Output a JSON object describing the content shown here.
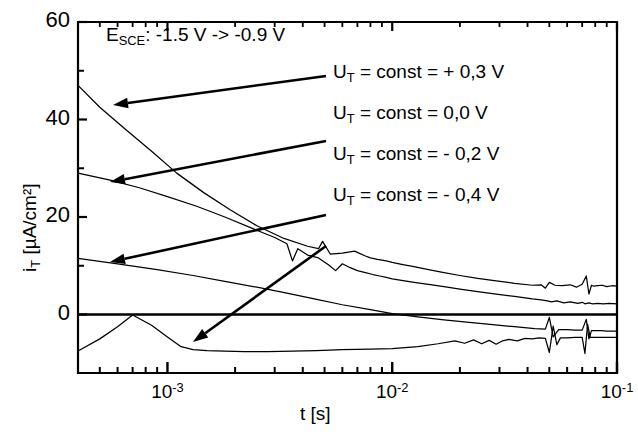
{
  "figure": {
    "background": "#ffffff",
    "line_color": "#000000",
    "axis_color": "#000000"
  },
  "annotation": {
    "head_note_prefix": "E",
    "head_note_sub": "SCE",
    "head_note_rest": ": -1.5 V -> -0.9 V"
  },
  "axes": {
    "y_label_prefix": "i",
    "y_label_sub": "T",
    "y_label_rest": " [µA/cm²]",
    "x_label": "t [s]",
    "y_ticks": [
      "60",
      "40",
      "20",
      "0"
    ],
    "y_tick_values": [
      60,
      40,
      20,
      0
    ],
    "y_minor_values": [
      50,
      30,
      10
    ],
    "x_ticks": [
      {
        "mantissa": "10",
        "exponent": "-3"
      },
      {
        "mantissa": "10",
        "exponent": "-2"
      },
      {
        "mantissa": "10",
        "exponent": "-1"
      }
    ]
  },
  "legend": [
    {
      "prefix": "U",
      "sub": "T",
      "rest": " = const = + 0,3 V",
      "value": 0.3
    },
    {
      "prefix": "U",
      "sub": "T",
      "rest": " = const =   0,0  V",
      "value": 0.0
    },
    {
      "prefix": "U",
      "sub": "T",
      "rest": " = const = - 0,2 V",
      "value": -0.2
    },
    {
      "prefix": "U",
      "sub": "T",
      "rest": " = const = - 0,4  V",
      "value": -0.4
    }
  ],
  "chart_data": {
    "type": "line",
    "title": "",
    "subtitle": "",
    "xlabel": "t [s]",
    "ylabel": "i_T [µA/cm²]",
    "xscale": "log",
    "yscale": "linear",
    "xlim": [
      0.0004,
      0.1
    ],
    "ylim": [
      -12,
      60
    ],
    "grid": false,
    "legend_position": "inside-right",
    "annotations": [
      {
        "text": "E_SCE : -1.5 V -> -0.9 V",
        "x": 0.0009,
        "y": 55
      }
    ],
    "zero_line": 0,
    "series": [
      {
        "name": "U_T = const = + 0,3 V",
        "x": [
          0.0004,
          0.0005,
          0.00065,
          0.00085,
          0.0011,
          0.00145,
          0.0019,
          0.0025,
          0.0033,
          0.0042,
          0.0047,
          0.0049,
          0.0053,
          0.006,
          0.0068,
          0.0076,
          0.008,
          0.0086,
          0.0094,
          0.01,
          0.011,
          0.0125,
          0.0145,
          0.017,
          0.02,
          0.024,
          0.029,
          0.035,
          0.042,
          0.046,
          0.048,
          0.05,
          0.053,
          0.057,
          0.062,
          0.066,
          0.07,
          0.073,
          0.075,
          0.077,
          0.079,
          0.082,
          0.086,
          0.09,
          0.095,
          0.1
        ],
        "y": [
          47.0,
          42.5,
          38.0,
          33.5,
          29.0,
          25.0,
          21.5,
          18.2,
          15.6,
          14.0,
          13.5,
          15.0,
          12.4,
          12.6,
          13.0,
          12.0,
          11.6,
          11.3,
          11.0,
          10.7,
          10.3,
          9.8,
          9.2,
          8.6,
          8.0,
          7.4,
          6.9,
          6.4,
          6.0,
          6.1,
          5.4,
          6.6,
          6.0,
          5.9,
          6.1,
          5.6,
          6.2,
          7.9,
          4.2,
          6.0,
          5.8,
          5.9,
          6.0,
          5.7,
          5.9,
          5.8
        ]
      },
      {
        "name": "U_T = const =   0,0  V",
        "x": [
          0.0004,
          0.00055,
          0.00075,
          0.001,
          0.00135,
          0.0018,
          0.0024,
          0.003,
          0.0034,
          0.0036,
          0.0038,
          0.0042,
          0.0047,
          0.0052,
          0.0056,
          0.006,
          0.0065,
          0.007,
          0.0076,
          0.0082,
          0.0088,
          0.0094,
          0.01,
          0.011,
          0.0125,
          0.0145,
          0.017,
          0.02,
          0.024,
          0.029,
          0.035,
          0.042,
          0.046,
          0.049,
          0.051,
          0.054,
          0.058,
          0.062,
          0.067,
          0.07,
          0.072,
          0.075,
          0.078,
          0.082,
          0.087,
          0.092,
          0.1
        ],
        "y": [
          29.0,
          27.6,
          26.0,
          24.2,
          22.2,
          20.0,
          17.6,
          15.8,
          14.5,
          11.0,
          13.5,
          12.2,
          11.6,
          10.2,
          9.0,
          10.4,
          9.6,
          9.0,
          8.6,
          8.2,
          7.9,
          7.6,
          7.3,
          7.0,
          6.6,
          6.2,
          5.7,
          5.2,
          4.7,
          4.2,
          3.7,
          3.2,
          3.0,
          2.8,
          2.6,
          2.8,
          2.4,
          2.6,
          2.3,
          2.5,
          2.2,
          2.4,
          2.2,
          2.3,
          2.2,
          2.3,
          2.2
        ]
      },
      {
        "name": "U_T = const = - 0,2 V",
        "x": [
          0.0004,
          0.0006,
          0.0009,
          0.0013,
          0.0018,
          0.0025,
          0.0034,
          0.0045,
          0.006,
          0.008,
          0.01,
          0.013,
          0.017,
          0.022,
          0.028,
          0.035,
          0.043,
          0.048,
          0.05,
          0.052,
          0.055,
          0.06,
          0.065,
          0.07,
          0.073,
          0.075,
          0.077,
          0.08,
          0.085,
          0.09,
          0.095,
          0.1
        ],
        "y": [
          11.5,
          10.4,
          9.2,
          8.0,
          6.8,
          5.6,
          4.4,
          3.2,
          2.0,
          1.0,
          0.2,
          -0.5,
          -1.1,
          -1.6,
          -2.1,
          -2.5,
          -2.9,
          -3.0,
          -0.6,
          -4.6,
          -3.1,
          -3.1,
          -3.2,
          -3.2,
          -1.0,
          -5.0,
          -3.3,
          -3.3,
          -3.3,
          -3.4,
          -3.4,
          -3.4
        ]
      },
      {
        "name": "U_T = const = - 0,4  V",
        "x": [
          0.0004,
          0.0005,
          0.0006,
          0.0007,
          0.00085,
          0.001,
          0.00115,
          0.0013,
          0.0015,
          0.0018,
          0.0022,
          0.0028,
          0.0036,
          0.0046,
          0.006,
          0.008,
          0.01,
          0.013,
          0.016,
          0.019,
          0.021,
          0.023,
          0.025,
          0.027,
          0.029,
          0.031,
          0.033,
          0.036,
          0.039,
          0.042,
          0.045,
          0.048,
          0.05,
          0.052,
          0.054,
          0.056,
          0.06,
          0.065,
          0.07,
          0.072,
          0.074,
          0.076,
          0.079,
          0.083,
          0.088,
          0.094,
          0.1
        ],
        "y": [
          -7.5,
          -5.0,
          -2.5,
          -0.1,
          -2.2,
          -4.6,
          -6.6,
          -7.2,
          -7.4,
          -7.5,
          -7.6,
          -7.6,
          -7.5,
          -7.4,
          -7.2,
          -7.1,
          -7.0,
          -6.6,
          -6.0,
          -5.4,
          -5.9,
          -5.2,
          -6.0,
          -5.3,
          -6.1,
          -5.4,
          -5.1,
          -5.4,
          -4.9,
          -5.0,
          -4.8,
          -4.9,
          -7.8,
          -2.4,
          -6.2,
          -4.8,
          -4.8,
          -4.7,
          -4.7,
          -8.0,
          -2.0,
          -4.7,
          -4.7,
          -4.7,
          -4.7,
          -4.7,
          -4.7
        ]
      }
    ]
  },
  "arrows": [
    {
      "name": "arrow-to-curve-1",
      "from_x": 326,
      "from_y": 76,
      "to_x": 113,
      "to_y": 105
    },
    {
      "name": "arrow-to-curve-2",
      "from_x": 326,
      "from_y": 141,
      "to_x": 110,
      "to_y": 182
    },
    {
      "name": "arrow-to-curve-3",
      "from_x": 326,
      "from_y": 215,
      "to_x": 110,
      "to_y": 262
    },
    {
      "name": "arrow-to-curve-4",
      "from_x": 326,
      "from_y": 246,
      "to_x": 193,
      "to_y": 342
    }
  ]
}
